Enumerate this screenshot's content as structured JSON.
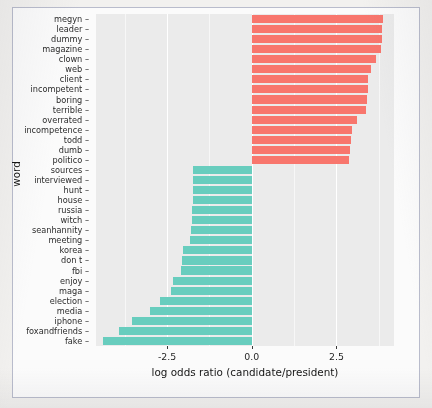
{
  "figure": {
    "xlabel": "log odds ratio (candidate/president)",
    "ylabel": "word"
  },
  "axis": {
    "xticks": [
      {
        "label": "-2.5",
        "value": -2.5
      },
      {
        "label": "0.0",
        "value": 0.0
      },
      {
        "label": "2.5",
        "value": 2.5
      }
    ]
  },
  "chart_data": {
    "type": "bar",
    "orientation": "horizontal",
    "title": "",
    "xlabel": "log odds ratio (candidate/president)",
    "ylabel": "word",
    "xlim": [
      -4.6,
      4.2
    ],
    "grid": true,
    "legend": "none",
    "colors": {
      "positive": "#f8766d",
      "negative": "#68cdbe",
      "panel": "#ebebeb"
    },
    "categories": [
      "megyn",
      "leader",
      "dummy",
      "magazine",
      "clown",
      "web",
      "client",
      "incompetent",
      "boring",
      "terrible",
      "overrated",
      "incompetence",
      "todd",
      "dumb",
      "politico",
      "sources",
      "interviewed",
      "hunt",
      "house",
      "russia",
      "witch",
      "seanhannity",
      "meeting",
      "korea",
      "don t",
      "fbi",
      "enjoy",
      "maga",
      "election",
      "media",
      "iphone",
      "foxandfriends",
      "fake"
    ],
    "values": [
      3.88,
      3.85,
      3.84,
      3.82,
      3.66,
      3.52,
      3.42,
      3.42,
      3.4,
      3.38,
      3.1,
      2.95,
      2.93,
      2.91,
      2.88,
      -1.74,
      -1.74,
      -1.74,
      -1.75,
      -1.76,
      -1.77,
      -1.78,
      -1.82,
      -2.04,
      -2.06,
      -2.08,
      -2.34,
      -2.38,
      -2.71,
      -3.02,
      -3.54,
      -3.92,
      -4.38
    ]
  }
}
